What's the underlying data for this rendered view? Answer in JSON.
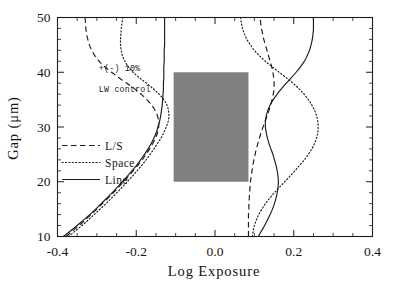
{
  "chart_data": {
    "type": "line",
    "title": "",
    "xlabel": "Log Exposure",
    "ylabel": "Gap (μm)",
    "xlim": [
      -0.4,
      0.4
    ],
    "ylim": [
      10,
      50
    ],
    "xticks": [
      -0.4,
      -0.2,
      0.0,
      0.2,
      0.4
    ],
    "xtick_labels": [
      "-0.4",
      "-0.2",
      "0.0",
      "0.2",
      "0.4"
    ],
    "yticks": [
      10,
      20,
      30,
      40,
      50
    ],
    "ytick_labels": [
      "10",
      "20",
      "30",
      "40",
      "50"
    ],
    "x_minor_interval": 0.05,
    "y_minor_interval": 2,
    "grid": false,
    "legend_position": "left-middle",
    "legend_entries": [
      {
        "label": "L/S",
        "style": "dashed"
      },
      {
        "label": "Space",
        "style": "dotted"
      },
      {
        "label": "Line",
        "style": "solid"
      }
    ],
    "annotations": [
      {
        "text": "+(-) 10%",
        "x": -0.295,
        "y": 40.2
      },
      {
        "text": "LW control",
        "x": -0.295,
        "y": 36.4
      }
    ],
    "shaded_region": {
      "label": "process window",
      "color": "#808080",
      "x_range": [
        -0.105,
        0.085
      ],
      "y_range": [
        20,
        40
      ]
    },
    "series": [
      {
        "name": "L/S",
        "style": "dashed",
        "branch": "lower",
        "points": [
          [
            -0.378,
            10.0
          ],
          [
            -0.362,
            11.0
          ],
          [
            -0.345,
            12.0
          ],
          [
            -0.33,
            13.0
          ],
          [
            -0.315,
            14.0
          ],
          [
            -0.3,
            15.0
          ],
          [
            -0.286,
            16.0
          ],
          [
            -0.272,
            17.0
          ],
          [
            -0.258,
            18.0
          ],
          [
            -0.245,
            19.0
          ],
          [
            -0.232,
            20.0
          ],
          [
            -0.22,
            21.0
          ],
          [
            -0.208,
            22.0
          ],
          [
            -0.196,
            23.0
          ],
          [
            -0.185,
            24.0
          ],
          [
            -0.175,
            25.0
          ],
          [
            -0.166,
            26.0
          ],
          [
            -0.158,
            27.0
          ],
          [
            -0.151,
            28.0
          ],
          [
            -0.146,
            29.0
          ],
          [
            -0.143,
            30.0
          ],
          [
            -0.143,
            31.0
          ],
          [
            -0.146,
            32.0
          ],
          [
            -0.152,
            33.0
          ],
          [
            -0.161,
            34.0
          ],
          [
            -0.173,
            35.0
          ],
          [
            -0.188,
            36.0
          ],
          [
            -0.205,
            37.0
          ],
          [
            -0.224,
            38.0
          ],
          [
            -0.244,
            39.0
          ],
          [
            -0.263,
            40.0
          ],
          [
            -0.28,
            41.0
          ],
          [
            -0.294,
            42.0
          ],
          [
            -0.305,
            43.0
          ],
          [
            -0.313,
            44.0
          ],
          [
            -0.319,
            45.0
          ],
          [
            -0.323,
            46.0
          ],
          [
            -0.326,
            47.0
          ],
          [
            -0.328,
            48.0
          ],
          [
            -0.329,
            49.0
          ],
          [
            -0.33,
            50.0
          ]
        ]
      },
      {
        "name": "L/S",
        "style": "dashed",
        "branch": "upper",
        "points": [
          [
            0.085,
            10.0
          ],
          [
            0.085,
            11.0
          ],
          [
            0.085,
            12.0
          ],
          [
            0.085,
            13.0
          ],
          [
            0.085,
            14.0
          ],
          [
            0.086,
            15.0
          ],
          [
            0.086,
            16.0
          ],
          [
            0.087,
            17.0
          ],
          [
            0.088,
            18.0
          ],
          [
            0.089,
            19.0
          ],
          [
            0.09,
            20.0
          ],
          [
            0.092,
            21.0
          ],
          [
            0.094,
            22.0
          ],
          [
            0.096,
            23.0
          ],
          [
            0.099,
            24.0
          ],
          [
            0.102,
            25.0
          ],
          [
            0.105,
            26.0
          ],
          [
            0.109,
            27.0
          ],
          [
            0.113,
            28.0
          ],
          [
            0.117,
            29.0
          ],
          [
            0.122,
            30.0
          ],
          [
            0.127,
            31.0
          ],
          [
            0.132,
            32.0
          ],
          [
            0.137,
            33.0
          ],
          [
            0.141,
            34.0
          ],
          [
            0.145,
            35.0
          ],
          [
            0.148,
            36.0
          ],
          [
            0.15,
            37.0
          ],
          [
            0.15,
            38.0
          ],
          [
            0.149,
            39.0
          ],
          [
            0.147,
            40.0
          ],
          [
            0.144,
            41.0
          ],
          [
            0.14,
            42.0
          ],
          [
            0.136,
            43.0
          ],
          [
            0.132,
            44.0
          ],
          [
            0.128,
            45.0
          ],
          [
            0.124,
            46.0
          ],
          [
            0.121,
            47.0
          ],
          [
            0.118,
            48.0
          ],
          [
            0.116,
            49.0
          ],
          [
            0.115,
            50.0
          ]
        ]
      },
      {
        "name": "Space",
        "style": "dotted",
        "branch": "lower",
        "points": [
          [
            -0.372,
            10.0
          ],
          [
            -0.355,
            11.0
          ],
          [
            -0.338,
            12.0
          ],
          [
            -0.322,
            13.0
          ],
          [
            -0.307,
            14.0
          ],
          [
            -0.292,
            15.0
          ],
          [
            -0.277,
            16.0
          ],
          [
            -0.263,
            17.0
          ],
          [
            -0.249,
            18.0
          ],
          [
            -0.236,
            19.0
          ],
          [
            -0.223,
            20.0
          ],
          [
            -0.21,
            21.0
          ],
          [
            -0.198,
            22.0
          ],
          [
            -0.186,
            23.0
          ],
          [
            -0.175,
            24.0
          ],
          [
            -0.165,
            25.0
          ],
          [
            -0.155,
            26.0
          ],
          [
            -0.146,
            27.0
          ],
          [
            -0.137,
            28.0
          ],
          [
            -0.13,
            29.0
          ],
          [
            -0.124,
            30.0
          ],
          [
            -0.119,
            31.0
          ],
          [
            -0.117,
            32.0
          ],
          [
            -0.118,
            33.0
          ],
          [
            -0.122,
            34.0
          ],
          [
            -0.13,
            35.0
          ],
          [
            -0.142,
            36.0
          ],
          [
            -0.157,
            37.0
          ],
          [
            -0.174,
            38.0
          ],
          [
            -0.192,
            39.0
          ],
          [
            -0.208,
            40.0
          ],
          [
            -0.22,
            41.0
          ],
          [
            -0.229,
            42.0
          ],
          [
            -0.235,
            43.0
          ],
          [
            -0.238,
            44.0
          ],
          [
            -0.24,
            45.0
          ],
          [
            -0.24,
            46.0
          ],
          [
            -0.239,
            47.0
          ],
          [
            -0.238,
            48.0
          ],
          [
            -0.236,
            49.0
          ],
          [
            -0.235,
            50.0
          ]
        ]
      },
      {
        "name": "Space",
        "style": "dotted",
        "branch": "upper",
        "points": [
          [
            0.095,
            10.0
          ],
          [
            0.097,
            11.0
          ],
          [
            0.1,
            12.0
          ],
          [
            0.105,
            13.0
          ],
          [
            0.111,
            14.0
          ],
          [
            0.119,
            15.0
          ],
          [
            0.128,
            16.0
          ],
          [
            0.139,
            17.0
          ],
          [
            0.151,
            18.0
          ],
          [
            0.164,
            19.0
          ],
          [
            0.177,
            20.0
          ],
          [
            0.19,
            21.0
          ],
          [
            0.203,
            22.0
          ],
          [
            0.215,
            23.0
          ],
          [
            0.227,
            24.0
          ],
          [
            0.237,
            25.0
          ],
          [
            0.246,
            26.0
          ],
          [
            0.253,
            27.0
          ],
          [
            0.258,
            28.0
          ],
          [
            0.261,
            29.0
          ],
          [
            0.262,
            30.0
          ],
          [
            0.261,
            31.0
          ],
          [
            0.258,
            32.0
          ],
          [
            0.253,
            33.0
          ],
          [
            0.246,
            34.0
          ],
          [
            0.237,
            35.0
          ],
          [
            0.226,
            36.0
          ],
          [
            0.213,
            37.0
          ],
          [
            0.198,
            38.0
          ],
          [
            0.181,
            39.0
          ],
          [
            0.163,
            40.0
          ],
          [
            0.145,
            41.0
          ],
          [
            0.128,
            42.0
          ],
          [
            0.113,
            43.0
          ],
          [
            0.1,
            44.0
          ],
          [
            0.09,
            45.0
          ],
          [
            0.081,
            46.0
          ],
          [
            0.075,
            47.0
          ],
          [
            0.07,
            48.0
          ],
          [
            0.067,
            49.0
          ],
          [
            0.065,
            50.0
          ]
        ]
      },
      {
        "name": "Line",
        "style": "solid",
        "branch": "lower",
        "points": [
          [
            -0.385,
            10.0
          ],
          [
            -0.367,
            11.0
          ],
          [
            -0.35,
            12.0
          ],
          [
            -0.334,
            13.0
          ],
          [
            -0.318,
            14.0
          ],
          [
            -0.303,
            15.0
          ],
          [
            -0.289,
            16.0
          ],
          [
            -0.275,
            17.0
          ],
          [
            -0.261,
            18.0
          ],
          [
            -0.248,
            19.0
          ],
          [
            -0.235,
            20.0
          ],
          [
            -0.223,
            21.0
          ],
          [
            -0.211,
            22.0
          ],
          [
            -0.199,
            23.0
          ],
          [
            -0.189,
            24.0
          ],
          [
            -0.179,
            25.0
          ],
          [
            -0.17,
            26.0
          ],
          [
            -0.162,
            27.0
          ],
          [
            -0.155,
            28.0
          ],
          [
            -0.149,
            29.0
          ],
          [
            -0.145,
            30.0
          ],
          [
            -0.141,
            31.0
          ],
          [
            -0.138,
            32.0
          ],
          [
            -0.136,
            33.0
          ],
          [
            -0.134,
            34.0
          ],
          [
            -0.133,
            35.0
          ],
          [
            -0.132,
            36.0
          ],
          [
            -0.131,
            37.0
          ],
          [
            -0.131,
            38.0
          ],
          [
            -0.13,
            39.0
          ],
          [
            -0.13,
            40.0
          ],
          [
            -0.13,
            41.0
          ],
          [
            -0.129,
            42.0
          ],
          [
            -0.129,
            43.0
          ],
          [
            -0.129,
            44.0
          ],
          [
            -0.128,
            45.0
          ],
          [
            -0.128,
            46.0
          ],
          [
            -0.128,
            47.0
          ],
          [
            -0.128,
            48.0
          ],
          [
            -0.128,
            49.0
          ],
          [
            -0.128,
            50.0
          ]
        ]
      },
      {
        "name": "Line",
        "style": "solid",
        "branch": "upper",
        "points": [
          [
            0.11,
            10.0
          ],
          [
            0.118,
            11.0
          ],
          [
            0.126,
            12.0
          ],
          [
            0.133,
            13.0
          ],
          [
            0.14,
            14.0
          ],
          [
            0.146,
            15.0
          ],
          [
            0.151,
            16.0
          ],
          [
            0.155,
            17.0
          ],
          [
            0.158,
            18.0
          ],
          [
            0.16,
            19.0
          ],
          [
            0.161,
            20.0
          ],
          [
            0.16,
            21.0
          ],
          [
            0.158,
            22.0
          ],
          [
            0.155,
            23.0
          ],
          [
            0.151,
            24.0
          ],
          [
            0.147,
            25.0
          ],
          [
            0.142,
            26.0
          ],
          [
            0.137,
            27.0
          ],
          [
            0.133,
            28.0
          ],
          [
            0.13,
            29.0
          ],
          [
            0.128,
            30.0
          ],
          [
            0.128,
            31.0
          ],
          [
            0.13,
            32.0
          ],
          [
            0.134,
            33.0
          ],
          [
            0.14,
            34.0
          ],
          [
            0.148,
            35.0
          ],
          [
            0.158,
            36.0
          ],
          [
            0.169,
            37.0
          ],
          [
            0.181,
            38.0
          ],
          [
            0.194,
            39.0
          ],
          [
            0.206,
            40.0
          ],
          [
            0.217,
            41.0
          ],
          [
            0.227,
            42.0
          ],
          [
            0.234,
            43.0
          ],
          [
            0.24,
            44.0
          ],
          [
            0.244,
            45.0
          ],
          [
            0.247,
            46.0
          ],
          [
            0.249,
            47.0
          ],
          [
            0.25,
            48.0
          ],
          [
            0.25,
            49.0
          ],
          [
            0.25,
            50.0
          ]
        ]
      }
    ]
  }
}
